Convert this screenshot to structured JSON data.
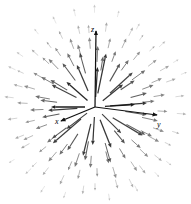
{
  "figure": {
    "title": "",
    "background_color": "#ffffff",
    "width": 191,
    "height": 204
  },
  "axes": {
    "origin": {
      "x": 95,
      "y": 107
    },
    "items": [
      {
        "name": "z-axis",
        "label": "z",
        "label_x": 91,
        "label_y": 32,
        "tip_x": 96,
        "tip_y": 31,
        "color": "#111111"
      },
      {
        "name": "x-axis",
        "label": "x",
        "label_x": 55,
        "label_y": 124,
        "tip_x": 61,
        "tip_y": 121,
        "color": "#111111"
      },
      {
        "name": "y-axis",
        "label": "y",
        "label_x": 157,
        "label_y": 127,
        "tip_x": 157,
        "tip_y": 115,
        "color": "#111111"
      }
    ]
  },
  "chart_data": {
    "type": "scatter",
    "plot_kind": "3d-radial-vector-field",
    "title": "",
    "xlabel": "x",
    "ylabel": "y",
    "zlabel": "z",
    "legend": [],
    "grid": false,
    "projection": {
      "origin_px": [
        95,
        107
      ],
      "x_axis_px": [
        -34,
        14
      ],
      "y_axis_px": [
        62,
        8
      ],
      "z_axis_px": [
        1,
        -76
      ]
    },
    "field": {
      "direction": "outward",
      "magnitude_rule": "decreases-with-radius",
      "max_arrow_px": 34,
      "min_arrow_px": 4
    },
    "vectors": [
      {
        "x": -34,
        "y": 0,
        "len": 34,
        "w": 1.5,
        "op": 0.95
      },
      {
        "x": 33,
        "y": -2,
        "len": 30,
        "w": 1.4,
        "op": 0.92
      },
      {
        "x": 2,
        "y": -32,
        "len": 30,
        "w": 1.3,
        "op": 0.88
      },
      {
        "x": -2,
        "y": 33,
        "len": 28,
        "w": 1.2,
        "op": 0.85
      },
      {
        "x": -25,
        "y": -22,
        "len": 28,
        "w": 1.3,
        "op": 0.9
      },
      {
        "x": 24,
        "y": 24,
        "len": 27,
        "w": 1.1,
        "op": 0.8
      },
      {
        "x": -26,
        "y": 20,
        "len": 26,
        "w": 1.1,
        "op": 0.82
      },
      {
        "x": 26,
        "y": -21,
        "len": 26,
        "w": 1.2,
        "op": 0.84
      }
    ],
    "ring_counts": [
      0,
      10,
      16,
      22,
      26,
      30,
      26
    ],
    "ring_radii_px": [
      0,
      18,
      34,
      50,
      64,
      78,
      92
    ]
  }
}
